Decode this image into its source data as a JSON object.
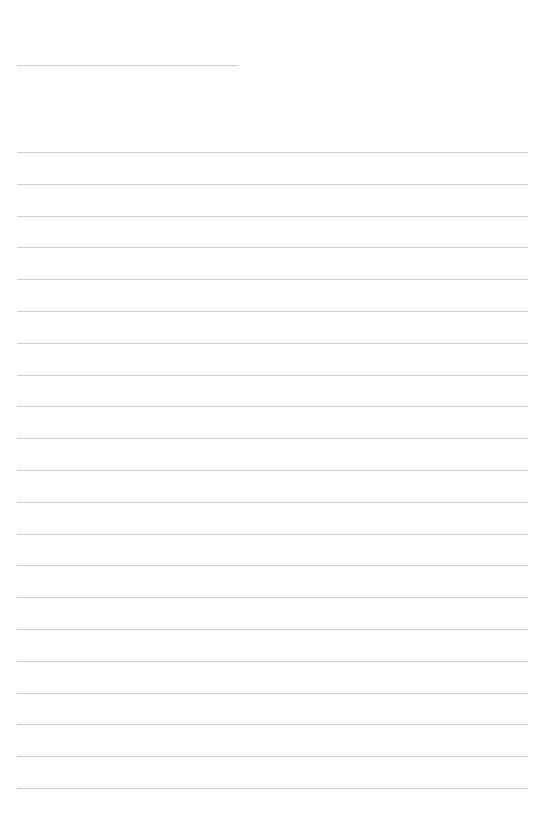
{
  "document": {
    "type": "lined-notepaper",
    "background_color": "#ffffff",
    "line_color": "#cfcfcf",
    "title_line": {
      "x": 17,
      "y": 65,
      "width": 221
    },
    "ruled_lines": {
      "x": 17,
      "width": 511,
      "first_y": 152,
      "spacing": 31.8,
      "count": 21
    }
  }
}
